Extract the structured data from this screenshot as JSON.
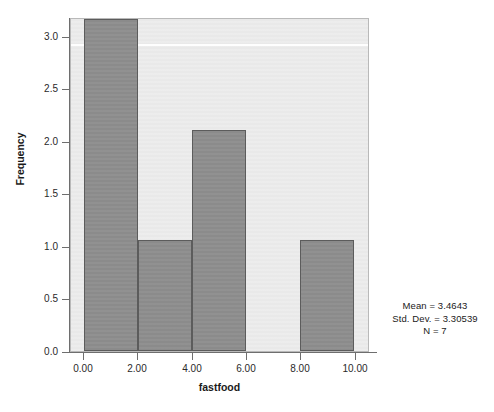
{
  "chart_data": {
    "type": "bar",
    "title": "",
    "subtitle": "",
    "xlabel": "fastfood",
    "ylabel": "Frequency",
    "bin_width": 2,
    "categories": [
      "0.00-2.00",
      "2.00-4.00",
      "4.00-6.00",
      "6.00-8.00",
      "8.00-10.00"
    ],
    "bin_edges": [
      0,
      2,
      4,
      6,
      8,
      10
    ],
    "values": [
      3,
      1,
      2,
      0,
      1
    ],
    "xlim": [
      0,
      10
    ],
    "ylim": [
      0,
      3
    ],
    "x_ticks": [
      0,
      2,
      4,
      6,
      8,
      10
    ],
    "x_tick_labels": [
      "0.00",
      "2.00",
      "4.00",
      "6.00",
      "8.00",
      "10.00"
    ],
    "y_ticks": [
      0,
      0.5,
      1,
      1.5,
      2,
      2.5,
      3
    ],
    "y_tick_labels": [
      "0.0",
      "0.5",
      "1.0",
      "1.5",
      "2.0",
      "2.5",
      "3.0"
    ],
    "grid": false,
    "legend": false,
    "bar_color": "#8b8b8b",
    "bar_border_color": "#5c5c5c",
    "plot_background": "#e9e9e9",
    "figure_background": "#ffffff"
  },
  "axes": {
    "x_title": "fastfood",
    "y_title": "Frequency",
    "x_tick_labels": [
      "0.00",
      "2.00",
      "4.00",
      "6.00",
      "8.00",
      "10.00"
    ],
    "y_tick_labels": [
      "0.0",
      "0.5",
      "1.0",
      "1.5",
      "2.0",
      "2.5",
      "3.0"
    ]
  },
  "stats": {
    "mean": "Mean = 3.4643",
    "std_dev": "Std. Dev. = 3.30539",
    "n": "N = 7"
  }
}
